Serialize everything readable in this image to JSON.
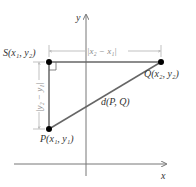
{
  "diagram": {
    "axes": {
      "x_label": "x",
      "y_label": "y"
    },
    "points": {
      "S": {
        "label": "S(x₁, y₂)"
      },
      "Q": {
        "label": "Q(x₂, y₂)"
      },
      "P": {
        "label": "P(x₁, y₁)"
      }
    },
    "segment_label": "d(P, Q)",
    "horizontal_dim": "|x₂ − x₁|",
    "vertical_dim": "|y₂ − y₁|",
    "colors": {
      "segments": "#666666",
      "axes": "#777777",
      "points": "#000000",
      "dims": "#999999"
    }
  }
}
